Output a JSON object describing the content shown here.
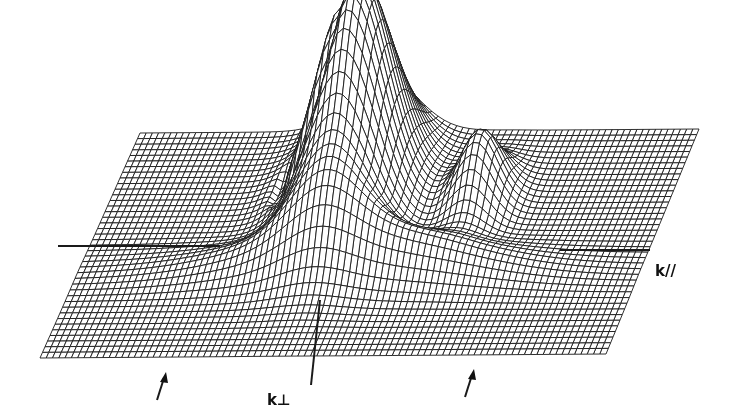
{
  "figure": {
    "type": "3d-wireframe-surface",
    "axes": {
      "k_parallel": {
        "label": "k//"
      },
      "k_perpendicular": {
        "label": "k⊥"
      }
    },
    "markers": [
      {
        "name": "arrow-left",
        "x": 162,
        "y": 386
      },
      {
        "name": "arrow-right",
        "x": 470,
        "y": 383
      }
    ],
    "colors": {
      "line": "#1a1a1a",
      "background": "#ffffff"
    },
    "plane_corners": {
      "top_left": [
        140,
        133
      ],
      "top_right": [
        699,
        129
      ],
      "bottom_right": [
        606,
        354
      ],
      "bottom_left": [
        40,
        358
      ]
    },
    "grid": {
      "u_lines": 90,
      "v_lines": 40
    },
    "features": {
      "main_peak": {
        "u": 0.435,
        "v": 0.3,
        "height": 225,
        "su": 0.06,
        "sv": 0.18
      },
      "secondary_ridge": {
        "u": 0.5,
        "v": 0.62,
        "height": 45,
        "su": 0.18,
        "sv": 0.07
      },
      "side_bump": {
        "u": 0.66,
        "v": 0.32,
        "height": 70,
        "su": 0.035,
        "sv": 0.1
      },
      "ring_dip": {
        "u": 0.36,
        "v": 0.3,
        "depth": 18,
        "r": 0.12
      }
    }
  }
}
